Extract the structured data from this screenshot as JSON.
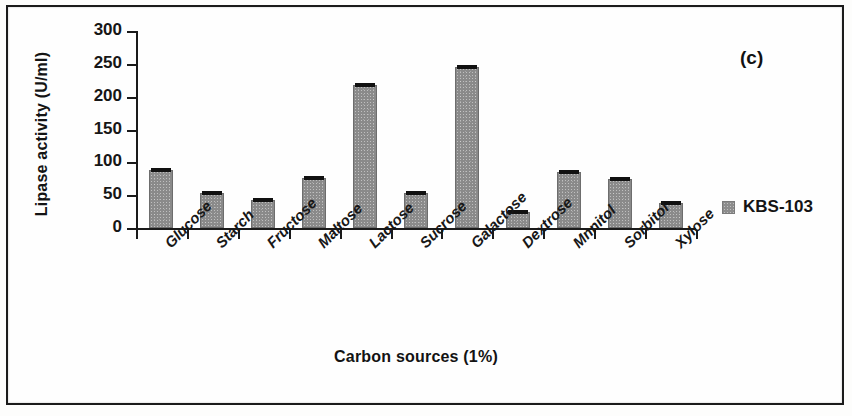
{
  "figure": {
    "panel_tag": "(c)"
  },
  "legend": {
    "position": "right",
    "entries": [
      {
        "label": "KBS-103",
        "color": "#8a8a8a",
        "marker": "square-swatch-icon"
      }
    ]
  },
  "axes": {
    "y_title": "Lipase activity (U/ml)",
    "x_title": "Carbon sources (1%)",
    "y_ticks": [
      "0",
      "50",
      "100",
      "150",
      "200",
      "250",
      "300"
    ]
  },
  "chart_data": {
    "type": "bar",
    "title": "",
    "subtitle": "",
    "panel_label": "(c)",
    "xlabel": "Carbon sources (1%)",
    "ylabel": "Lipase activity (U/ml)",
    "ylim": [
      0,
      300
    ],
    "ytick_values": [
      0,
      50,
      100,
      150,
      200,
      250,
      300
    ],
    "grid": false,
    "legend_position": "right",
    "categories": [
      "Glucose",
      "Starch",
      "Fructose",
      "Maltose",
      "Lactose",
      "Sucrose",
      "Galactose",
      "Dextrose",
      "Mnnitol",
      "Sorbitol",
      "Xylose"
    ],
    "series": [
      {
        "name": "KBS-103",
        "color": "#8a8a8a",
        "values": [
          89,
          53,
          43,
          76,
          218,
          54,
          245,
          25,
          85,
          74,
          38
        ],
        "errors": [
          3,
          2,
          2,
          2,
          3,
          2,
          3,
          2,
          2,
          2,
          2
        ]
      }
    ]
  }
}
